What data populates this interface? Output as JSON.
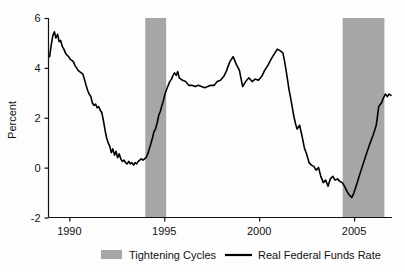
{
  "chart_data": {
    "type": "line",
    "title": "",
    "xlabel": "",
    "ylabel": "Percent",
    "xlim": [
      1988.9,
      2007.0
    ],
    "ylim": [
      -2,
      6
    ],
    "grid": false,
    "xticks": [
      1990,
      1995,
      2000,
      2005
    ],
    "xtick_labels": [
      "1990",
      "1995",
      "2000",
      "2005"
    ],
    "yticks": [
      -2,
      0,
      2,
      4,
      6
    ],
    "ytick_labels": [
      "-2",
      "0",
      "2",
      "4",
      "6"
    ],
    "legend_position": "below-axes",
    "legend": [
      {
        "name": "Tightening Cycles",
        "type": "band",
        "color": "#a6a6a6"
      },
      {
        "name": "Real Federal Funds Rate",
        "type": "line",
        "color": "#000000"
      }
    ],
    "bands": [
      {
        "label": "Tightening Cycles",
        "x0": 1994.0,
        "x1": 1995.1,
        "color": "#a6a6a6"
      },
      {
        "label": "Tightening Cycles",
        "x0": 2004.4,
        "x1": 2006.6,
        "color": "#a6a6a6"
      }
    ],
    "series": [
      {
        "name": "Real Federal Funds Rate",
        "color": "#000000",
        "x": [
          1988.96,
          1989.04,
          1989.13,
          1989.21,
          1989.29,
          1989.38,
          1989.46,
          1989.54,
          1989.63,
          1989.71,
          1989.79,
          1989.88,
          1989.96,
          1990.04,
          1990.13,
          1990.21,
          1990.29,
          1990.38,
          1990.46,
          1990.54,
          1990.63,
          1990.71,
          1990.79,
          1990.88,
          1990.96,
          1991.04,
          1991.13,
          1991.21,
          1991.29,
          1991.38,
          1991.46,
          1991.54,
          1991.63,
          1991.71,
          1991.79,
          1991.88,
          1991.96,
          1992.04,
          1992.13,
          1992.21,
          1992.29,
          1992.38,
          1992.46,
          1992.54,
          1992.63,
          1992.71,
          1992.79,
          1992.88,
          1992.96,
          1993.04,
          1993.13,
          1993.21,
          1993.29,
          1993.38,
          1993.46,
          1993.54,
          1993.63,
          1993.71,
          1993.79,
          1993.88,
          1993.96,
          1994.04,
          1994.13,
          1994.21,
          1994.29,
          1994.38,
          1994.46,
          1994.54,
          1994.63,
          1994.71,
          1994.79,
          1994.88,
          1994.96,
          1995.04,
          1995.13,
          1995.21,
          1995.29,
          1995.38,
          1995.46,
          1995.54,
          1995.63,
          1995.71,
          1995.79,
          1995.88,
          1995.96,
          1996.13,
          1996.29,
          1996.46,
          1996.63,
          1996.79,
          1996.96,
          1997.13,
          1997.29,
          1997.46,
          1997.63,
          1997.79,
          1997.96,
          1998.13,
          1998.29,
          1998.38,
          1998.46,
          1998.63,
          1998.79,
          1998.96,
          1999.13,
          1999.29,
          1999.46,
          1999.63,
          1999.79,
          1999.96,
          2000.13,
          2000.29,
          2000.46,
          2000.63,
          2000.79,
          2000.96,
          2001.08,
          2001.17,
          2001.25,
          2001.33,
          2001.42,
          2001.5,
          2001.58,
          2001.67,
          2001.75,
          2001.83,
          2001.92,
          2002.0,
          2002.13,
          2002.25,
          2002.38,
          2002.5,
          2002.63,
          2002.75,
          2002.88,
          2003.0,
          2003.13,
          2003.25,
          2003.38,
          2003.5,
          2003.63,
          2003.75,
          2003.88,
          2004.0,
          2004.13,
          2004.25,
          2004.38,
          2004.5,
          2004.63,
          2004.75,
          2004.88,
          2005.0,
          2005.17,
          2005.33,
          2005.5,
          2005.67,
          2005.83,
          2006.0,
          2006.17,
          2006.33,
          2006.5,
          2006.67,
          2006.83,
          2006.95
        ],
        "y": [
          4.45,
          4.9,
          5.3,
          5.45,
          5.2,
          5.35,
          5.05,
          5.1,
          4.85,
          4.75,
          4.6,
          4.5,
          4.45,
          4.35,
          4.3,
          4.25,
          4.1,
          4.0,
          3.9,
          3.85,
          3.8,
          3.75,
          3.55,
          3.3,
          3.1,
          2.95,
          2.85,
          2.6,
          2.5,
          2.55,
          2.4,
          2.45,
          2.3,
          2.2,
          1.9,
          1.5,
          1.2,
          1.0,
          0.85,
          0.6,
          0.75,
          0.5,
          0.65,
          0.4,
          0.55,
          0.35,
          0.25,
          0.3,
          0.2,
          0.15,
          0.25,
          0.15,
          0.2,
          0.1,
          0.2,
          0.15,
          0.25,
          0.3,
          0.35,
          0.3,
          0.35,
          0.4,
          0.55,
          0.75,
          0.95,
          1.2,
          1.45,
          1.55,
          1.8,
          2.1,
          2.25,
          2.5,
          2.7,
          2.95,
          3.15,
          3.3,
          3.45,
          3.55,
          3.7,
          3.8,
          3.7,
          3.85,
          3.6,
          3.55,
          3.5,
          3.45,
          3.3,
          3.3,
          3.25,
          3.3,
          3.25,
          3.2,
          3.25,
          3.3,
          3.3,
          3.45,
          3.5,
          3.65,
          3.9,
          4.1,
          4.25,
          4.45,
          4.15,
          3.9,
          3.25,
          3.45,
          3.6,
          3.45,
          3.55,
          3.5,
          3.65,
          3.9,
          4.1,
          4.35,
          4.55,
          4.75,
          4.7,
          4.65,
          4.6,
          4.3,
          3.9,
          3.5,
          3.1,
          2.75,
          2.4,
          2.05,
          1.75,
          1.55,
          1.7,
          1.3,
          0.8,
          0.55,
          0.2,
          0.1,
          0.05,
          -0.1,
          0.0,
          -0.35,
          -0.6,
          -0.5,
          -0.75,
          -0.45,
          -0.35,
          -0.5,
          -0.45,
          -0.55,
          -0.6,
          -0.75,
          -0.95,
          -1.1,
          -1.2,
          -1.0,
          -0.6,
          -0.2,
          0.2,
          0.6,
          0.95,
          1.3,
          1.7,
          2.0,
          2.3,
          2.45,
          2.4,
          2.55
        ],
        "y_tail_x": [
          2006.3,
          2006.45,
          2006.55,
          2006.65,
          2006.75,
          2006.85,
          2006.95
        ],
        "y_tail_y": [
          2.45,
          2.6,
          2.8,
          2.95,
          2.85,
          2.95,
          2.9
        ]
      }
    ],
    "notes": {
      "peak_1989": 5.45,
      "trough_1993": 0.1,
      "peak_2000": 4.75,
      "trough_2004": -1.2,
      "end_2006": 2.9
    }
  },
  "axis": {
    "ylabel": "Percent"
  }
}
